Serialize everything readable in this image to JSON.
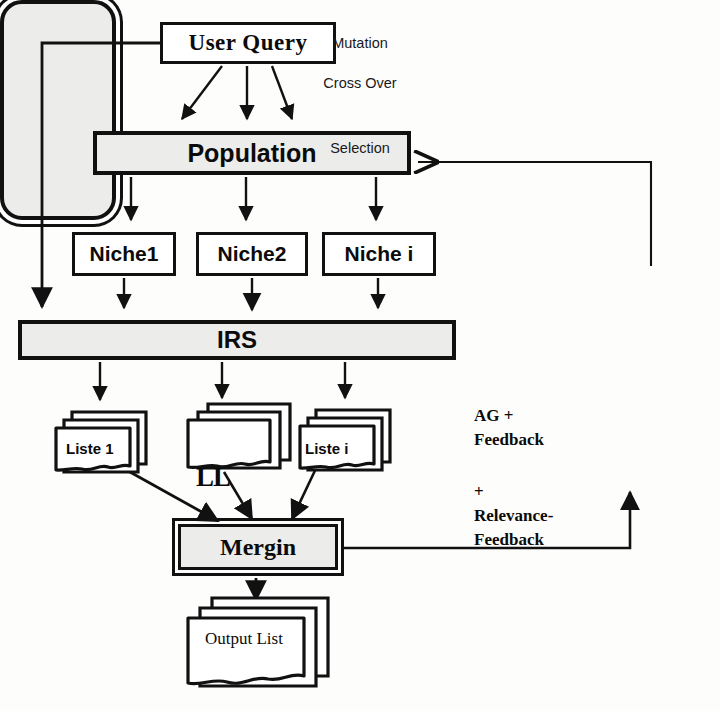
{
  "diagram": {
    "nodes": {
      "user_query": "User  Query",
      "population": "Population",
      "niche1": "Niche1",
      "niche2": "Niche2",
      "niche_i": "Niche  i",
      "irs": "IRS",
      "liste1": "Liste 1",
      "liste_middle": "",
      "liste_i": "Liste i",
      "ll": "LL",
      "mergin": "Mergin",
      "output_list": "Output List"
    },
    "ga_box": {
      "mutation": "Mutation",
      "cross_over": "Cross Over",
      "selection": "Selection"
    },
    "annotations": {
      "ag_feedback_line1": "AG +",
      "ag_feedback_line2": "Feedback",
      "relevance_line1": "+",
      "relevance_line2": "Relevance-",
      "relevance_line3": "Feedback"
    },
    "colors": {
      "stroke": "#111111",
      "fill_gray": "#ececea",
      "fill_white": "#ffffff",
      "background": "#fdfdfc"
    },
    "edges": [
      {
        "from": "user_query",
        "to": "population",
        "label": "",
        "arrow": "filled"
      },
      {
        "from": "user_query",
        "to": "population",
        "label": "",
        "arrow": "filled"
      },
      {
        "from": "user_query",
        "to": "population",
        "label": "",
        "arrow": "filled"
      },
      {
        "from": "user_query",
        "to": "irs",
        "label": "",
        "arrow": "filled"
      },
      {
        "from": "population",
        "to": "niche1",
        "label": "",
        "arrow": "filled"
      },
      {
        "from": "population",
        "to": "niche2",
        "label": "",
        "arrow": "filled"
      },
      {
        "from": "population",
        "to": "niche_i",
        "label": "",
        "arrow": "filled"
      },
      {
        "from": "niche1",
        "to": "irs",
        "label": "",
        "arrow": "filled"
      },
      {
        "from": "niche2",
        "to": "irs",
        "label": "",
        "arrow": "filled"
      },
      {
        "from": "niche_i",
        "to": "irs",
        "label": "",
        "arrow": "filled"
      },
      {
        "from": "irs",
        "to": "liste1",
        "label": "",
        "arrow": "filled"
      },
      {
        "from": "irs",
        "to": "liste_middle",
        "label": "",
        "arrow": "filled"
      },
      {
        "from": "irs",
        "to": "liste_i",
        "label": "",
        "arrow": "filled"
      },
      {
        "from": "liste1",
        "to": "mergin",
        "label": "",
        "arrow": "filled"
      },
      {
        "from": "liste_middle",
        "to": "mergin",
        "label": "",
        "arrow": "filled"
      },
      {
        "from": "liste_i",
        "to": "mergin",
        "label": "",
        "arrow": "filled"
      },
      {
        "from": "mergin",
        "to": "output_list",
        "label": "",
        "arrow": "filled"
      },
      {
        "from": "mergin",
        "to": "ga_box",
        "label": "AG + Feedback + Relevance-Feedback",
        "arrow": "filled"
      },
      {
        "from": "ga_box",
        "to": "population",
        "label": "",
        "arrow": "open"
      }
    ]
  }
}
